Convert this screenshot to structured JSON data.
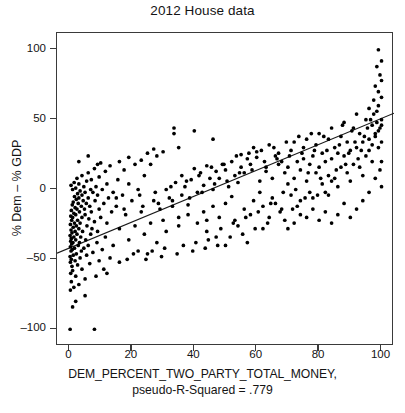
{
  "chart_data": {
    "type": "scatter",
    "title": "2012 House data",
    "xlabel": "DEM_PERCENT_TWO_PARTY_TOTAL_MONEY,",
    "xsublabel": "pseudo-R-Squared = .779",
    "ylabel": "% Dem – % GDP",
    "xlim": [
      -4,
      104
    ],
    "ylim": [
      -112,
      112
    ],
    "xticks": [
      0,
      20,
      40,
      60,
      80,
      100
    ],
    "yticks": [
      100,
      50,
      0,
      -50,
      -100
    ],
    "grid": false,
    "legend": null,
    "point_color": "#000000",
    "line_color": "#1a1a1a",
    "pseudo_r_squared": 0.779,
    "fit_line": {
      "type": "linear",
      "x_endpoints": [
        -4,
        104
      ],
      "y_endpoints": [
        -45.6,
        54.6
      ],
      "slope": 0.9278,
      "intercept": -41.9
    },
    "points": [
      [
        0.2,
        -100
      ],
      [
        8.0,
        -100
      ],
      [
        0.3,
        -72
      ],
      [
        1.4,
        -70
      ],
      [
        3.0,
        -68
      ],
      [
        0.6,
        -66
      ],
      [
        5.0,
        -64
      ],
      [
        2.0,
        -62
      ],
      [
        8.5,
        -62
      ],
      [
        0.4,
        -60
      ],
      [
        1.0,
        -58
      ],
      [
        4.0,
        -57
      ],
      [
        11.0,
        -57
      ],
      [
        0.8,
        -55
      ],
      [
        2.6,
        -54
      ],
      [
        6.5,
        -53
      ],
      [
        0.3,
        -52
      ],
      [
        1.8,
        -51
      ],
      [
        9.5,
        -51
      ],
      [
        0.6,
        -50
      ],
      [
        3.4,
        -49
      ],
      [
        13.0,
        -49
      ],
      [
        0.2,
        -48
      ],
      [
        1.2,
        -47
      ],
      [
        5.5,
        -47
      ],
      [
        2.2,
        -46
      ],
      [
        7.5,
        -45
      ],
      [
        0.5,
        -44
      ],
      [
        3.8,
        -44
      ],
      [
        10.5,
        -43
      ],
      [
        0.9,
        -43
      ],
      [
        1.6,
        -42
      ],
      [
        4.6,
        -42
      ],
      [
        0.3,
        -41
      ],
      [
        2.8,
        -40
      ],
      [
        6.0,
        -40
      ],
      [
        14.0,
        -40
      ],
      [
        0.7,
        -39
      ],
      [
        1.1,
        -38
      ],
      [
        3.2,
        -38
      ],
      [
        8.8,
        -38
      ],
      [
        0.4,
        -37
      ],
      [
        2.0,
        -36
      ],
      [
        5.2,
        -36
      ],
      [
        0.6,
        -35
      ],
      [
        1.4,
        -34
      ],
      [
        3.6,
        -34
      ],
      [
        11.5,
        -34
      ],
      [
        0.2,
        -33
      ],
      [
        2.4,
        -32
      ],
      [
        6.8,
        -32
      ],
      [
        0.8,
        -31
      ],
      [
        1.8,
        -30
      ],
      [
        4.2,
        -30
      ],
      [
        9.0,
        -30
      ],
      [
        0.5,
        -29
      ],
      [
        3.0,
        -28
      ],
      [
        7.2,
        -28
      ],
      [
        16.0,
        -28
      ],
      [
        1.2,
        -27
      ],
      [
        2.2,
        -26
      ],
      [
        5.6,
        -26
      ],
      [
        0.3,
        -25
      ],
      [
        1.6,
        -24
      ],
      [
        3.4,
        -24
      ],
      [
        12.0,
        -24
      ],
      [
        8.0,
        -23
      ],
      [
        0.7,
        -22
      ],
      [
        2.6,
        -22
      ],
      [
        6.2,
        -21
      ],
      [
        1.0,
        -20
      ],
      [
        4.0,
        -20
      ],
      [
        10.0,
        -20
      ],
      [
        0.4,
        -19
      ],
      [
        2.0,
        -18
      ],
      [
        5.0,
        -18
      ],
      [
        18.0,
        -18
      ],
      [
        1.4,
        -17
      ],
      [
        3.2,
        -16
      ],
      [
        7.0,
        -16
      ],
      [
        13.5,
        -16
      ],
      [
        0.6,
        -15
      ],
      [
        2.4,
        -14
      ],
      [
        4.8,
        -14
      ],
      [
        9.5,
        -14
      ],
      [
        1.8,
        -13
      ],
      [
        3.8,
        -12
      ],
      [
        6.5,
        -12
      ],
      [
        15.0,
        -12
      ],
      [
        0.9,
        -11
      ],
      [
        2.8,
        -10
      ],
      [
        5.4,
        -10
      ],
      [
        11.0,
        -10
      ],
      [
        1.2,
        -9
      ],
      [
        4.4,
        -8
      ],
      [
        8.2,
        -8
      ],
      [
        20.0,
        -8
      ],
      [
        2.2,
        -7
      ],
      [
        3.0,
        -6
      ],
      [
        6.0,
        -6
      ],
      [
        12.5,
        -6
      ],
      [
        1.6,
        -5
      ],
      [
        4.0,
        -4
      ],
      [
        9.0,
        -4
      ],
      [
        17.0,
        -4
      ],
      [
        2.6,
        -3
      ],
      [
        5.0,
        -2
      ],
      [
        7.5,
        -2
      ],
      [
        14.0,
        -2
      ],
      [
        3.4,
        -1
      ],
      [
        1.0,
        0
      ],
      [
        6.8,
        0
      ],
      [
        10.5,
        0
      ],
      [
        22.0,
        0
      ],
      [
        2.0,
        1
      ],
      [
        4.6,
        2
      ],
      [
        8.5,
        2
      ],
      [
        0.5,
        3
      ],
      [
        3.0,
        4
      ],
      [
        12.0,
        4
      ],
      [
        19.0,
        4
      ],
      [
        1.5,
        5
      ],
      [
        5.5,
        6
      ],
      [
        7.0,
        7
      ],
      [
        15.5,
        7
      ],
      [
        2.4,
        8
      ],
      [
        9.5,
        9
      ],
      [
        4.0,
        10
      ],
      [
        24.0,
        10
      ],
      [
        6.0,
        12
      ],
      [
        11.5,
        13
      ],
      [
        17.5,
        14
      ],
      [
        8.0,
        15
      ],
      [
        13.0,
        17
      ],
      [
        21.0,
        18
      ],
      [
        26.0,
        18
      ],
      [
        10.0,
        19
      ],
      [
        16.0,
        20
      ],
      [
        23.0,
        21
      ],
      [
        19.0,
        23
      ],
      [
        28.0,
        24
      ],
      [
        33.5,
        40
      ],
      [
        25.0,
        26
      ],
      [
        30.0,
        27
      ],
      [
        27.0,
        29
      ],
      [
        35.0,
        30
      ],
      [
        12.0,
        -60
      ],
      [
        22.0,
        -44
      ],
      [
        25.0,
        -46
      ],
      [
        16.0,
        -52
      ],
      [
        19.0,
        -36
      ],
      [
        28.0,
        -38
      ],
      [
        24.0,
        -32
      ],
      [
        31.0,
        -30
      ],
      [
        21.0,
        -26
      ],
      [
        26.0,
        -24
      ],
      [
        30.0,
        -22
      ],
      [
        35.0,
        -20
      ],
      [
        23.0,
        -16
      ],
      [
        29.0,
        -14
      ],
      [
        33.0,
        -12
      ],
      [
        38.0,
        -11
      ],
      [
        27.0,
        -8
      ],
      [
        32.0,
        -6
      ],
      [
        36.0,
        -4
      ],
      [
        41.0,
        -2
      ],
      [
        31.0,
        0
      ],
      [
        37.0,
        2
      ],
      [
        43.0,
        3
      ],
      [
        34.0,
        5
      ],
      [
        39.0,
        7
      ],
      [
        45.0,
        8
      ],
      [
        36.0,
        10
      ],
      [
        42.0,
        12
      ],
      [
        47.0,
        13
      ],
      [
        40.0,
        15
      ],
      [
        44.0,
        17
      ],
      [
        49.0,
        18
      ],
      [
        38.0,
        -18
      ],
      [
        43.0,
        -16
      ],
      [
        46.0,
        -12
      ],
      [
        41.0,
        -24
      ],
      [
        48.0,
        -20
      ],
      [
        35.0,
        -26
      ],
      [
        44.0,
        -30
      ],
      [
        50.0,
        -10
      ],
      [
        52.0,
        -5
      ],
      [
        46.0,
        0
      ],
      [
        51.0,
        2
      ],
      [
        54.0,
        5
      ],
      [
        48.0,
        8
      ],
      [
        53.0,
        10
      ],
      [
        56.0,
        12
      ],
      [
        50.0,
        14
      ],
      [
        55.0,
        16
      ],
      [
        58.0,
        18
      ],
      [
        52.0,
        20
      ],
      [
        57.0,
        22
      ],
      [
        60.0,
        23
      ],
      [
        47.0,
        -34
      ],
      [
        53.0,
        -22
      ],
      [
        56.0,
        -14
      ],
      [
        59.0,
        -8
      ],
      [
        61.0,
        -2
      ],
      [
        54.0,
        -26
      ],
      [
        58.0,
        -18
      ],
      [
        62.0,
        -12
      ],
      [
        55.0,
        25
      ],
      [
        60.0,
        27
      ],
      [
        63.0,
        13
      ],
      [
        57.0,
        -38
      ],
      [
        62.0,
        -28
      ],
      [
        64.0,
        -20
      ],
      [
        66.0,
        -10
      ],
      [
        61.0,
        6
      ],
      [
        65.0,
        8
      ],
      [
        63.0,
        16
      ],
      [
        67.0,
        18
      ],
      [
        59.0,
        30
      ],
      [
        64.0,
        32
      ],
      [
        68.0,
        20
      ],
      [
        66.0,
        24
      ],
      [
        69.0,
        12
      ],
      [
        70.0,
        4
      ],
      [
        65.0,
        -6
      ],
      [
        68.0,
        -14
      ],
      [
        71.0,
        -4
      ],
      [
        72.0,
        8
      ],
      [
        70.0,
        16
      ],
      [
        73.0,
        20
      ],
      [
        67.0,
        26
      ],
      [
        71.0,
        28
      ],
      [
        74.0,
        14
      ],
      [
        75.0,
        22
      ],
      [
        69.0,
        -22
      ],
      [
        73.0,
        -12
      ],
      [
        76.0,
        6
      ],
      [
        77.0,
        18
      ],
      [
        72.0,
        34
      ],
      [
        75.0,
        30
      ],
      [
        78.0,
        24
      ],
      [
        79.0,
        12
      ],
      [
        74.0,
        -8
      ],
      [
        77.0,
        -2
      ],
      [
        80.0,
        16
      ],
      [
        81.0,
        26
      ],
      [
        76.0,
        36
      ],
      [
        79.0,
        32
      ],
      [
        82.0,
        20
      ],
      [
        83.0,
        10
      ],
      [
        78.0,
        -6
      ],
      [
        81.0,
        4
      ],
      [
        84.0,
        22
      ],
      [
        85.0,
        30
      ],
      [
        80.0,
        40
      ],
      [
        83.0,
        36
      ],
      [
        86.0,
        26
      ],
      [
        87.0,
        16
      ],
      [
        82.0,
        -2
      ],
      [
        85.0,
        8
      ],
      [
        88.0,
        24
      ],
      [
        89.0,
        34
      ],
      [
        84.0,
        44
      ],
      [
        87.0,
        38
      ],
      [
        90.0,
        28
      ],
      [
        91.0,
        18
      ],
      [
        86.0,
        2
      ],
      [
        89.0,
        12
      ],
      [
        92.0,
        30
      ],
      [
        93.0,
        40
      ],
      [
        88.0,
        48
      ],
      [
        91.0,
        44
      ],
      [
        94.0,
        34
      ],
      [
        95.0,
        24
      ],
      [
        90.0,
        6
      ],
      [
        93.0,
        16
      ],
      [
        96.0,
        36
      ],
      [
        97.0,
        46
      ],
      [
        92.0,
        54
      ],
      [
        95.0,
        50
      ],
      [
        98.0,
        40
      ],
      [
        99.0,
        30
      ],
      [
        94.0,
        10
      ],
      [
        97.0,
        20
      ],
      [
        99.5,
        44
      ],
      [
        100.0,
        34
      ],
      [
        96.0,
        58
      ],
      [
        98.5,
        56
      ],
      [
        100.0,
        50
      ],
      [
        99.0,
        60
      ],
      [
        97.5,
        64
      ],
      [
        100.0,
        66
      ],
      [
        99.0,
        70
      ],
      [
        98.0,
        74
      ],
      [
        100.0,
        78
      ],
      [
        99.5,
        82
      ],
      [
        98.5,
        88
      ],
      [
        100.0,
        92
      ],
      [
        99.0,
        100
      ],
      [
        96.0,
        28
      ],
      [
        97.0,
        32
      ],
      [
        98.0,
        38
      ],
      [
        99.0,
        42
      ],
      [
        100.0,
        46
      ],
      [
        95.5,
        44
      ],
      [
        96.5,
        50
      ],
      [
        97.5,
        54
      ],
      [
        98.5,
        48
      ],
      [
        94.5,
        38
      ],
      [
        93.5,
        28
      ],
      [
        92.5,
        22
      ],
      [
        91.5,
        34
      ],
      [
        90.5,
        42
      ],
      [
        89.5,
        26
      ],
      [
        88.5,
        18
      ],
      [
        87.5,
        46
      ],
      [
        86.5,
        32
      ],
      [
        85.5,
        14
      ],
      [
        84.0,
        6
      ],
      [
        83.0,
        -4
      ],
      [
        82.5,
        28
      ],
      [
        81.5,
        38
      ],
      [
        80.5,
        8
      ],
      [
        79.5,
        -4
      ],
      [
        78.5,
        28
      ],
      [
        77.5,
        40
      ],
      [
        76.5,
        12
      ],
      [
        75.5,
        -6
      ],
      [
        74.5,
        26
      ],
      [
        73.5,
        38
      ],
      [
        72.5,
        0
      ],
      [
        71.5,
        -14
      ],
      [
        70.5,
        24
      ],
      [
        69.5,
        34
      ],
      [
        68.5,
        -2
      ],
      [
        67.5,
        -16
      ],
      [
        66.5,
        22
      ],
      [
        65.5,
        30
      ],
      [
        64.5,
        -10
      ],
      [
        63.5,
        -24
      ],
      [
        62.5,
        20
      ],
      [
        61.5,
        28
      ],
      [
        60.5,
        -16
      ],
      [
        59.5,
        -28
      ],
      [
        58.5,
        14
      ],
      [
        57.5,
        26
      ],
      [
        56.5,
        -20
      ],
      [
        55.5,
        -32
      ],
      [
        54.5,
        12
      ],
      [
        53.5,
        24
      ],
      [
        52.5,
        -24
      ],
      [
        51.5,
        -34
      ],
      [
        50.5,
        6
      ],
      [
        49.5,
        18
      ],
      [
        48.5,
        -28
      ],
      [
        47.5,
        -40
      ],
      [
        46.5,
        4
      ],
      [
        45.5,
        16
      ],
      [
        44.5,
        -36
      ],
      [
        43.5,
        -42
      ],
      [
        42.5,
        -2
      ],
      [
        41.5,
        10
      ],
      [
        40.5,
        -38
      ],
      [
        39.5,
        -44
      ],
      [
        38.5,
        -6
      ],
      [
        37.5,
        6
      ],
      [
        36.5,
        -40
      ],
      [
        34.5,
        -46
      ],
      [
        33.0,
        -8
      ],
      [
        32.5,
        2
      ],
      [
        30.5,
        -42
      ],
      [
        29.5,
        -48
      ],
      [
        28.5,
        -10
      ],
      [
        27.5,
        -2
      ],
      [
        26.5,
        -44
      ],
      [
        24.5,
        -50
      ],
      [
        23.5,
        -12
      ],
      [
        22.5,
        -4
      ],
      [
        20.5,
        -46
      ],
      [
        18.5,
        -50
      ],
      [
        17.5,
        -14
      ],
      [
        15.0,
        -6
      ],
      [
        6.0,
        24
      ],
      [
        3.0,
        20
      ],
      [
        9.0,
        18
      ],
      [
        5.0,
        -76
      ],
      [
        2.0,
        -80
      ],
      [
        1.0,
        -84
      ],
      [
        100.0,
        20
      ],
      [
        99.5,
        14
      ],
      [
        98.0,
        8
      ],
      [
        100.0,
        2
      ],
      [
        96.0,
        -2
      ],
      [
        94.0,
        -8
      ],
      [
        92.0,
        -14
      ],
      [
        90.0,
        -20
      ],
      [
        88.0,
        -10
      ],
      [
        86.0,
        -18
      ],
      [
        84.0,
        -24
      ],
      [
        82.0,
        -16
      ],
      [
        80.0,
        -22
      ],
      [
        78.0,
        -14
      ],
      [
        76.0,
        -20
      ],
      [
        74.0,
        -18
      ],
      [
        72.0,
        -24
      ],
      [
        70.0,
        -28
      ],
      [
        33.5,
        44
      ],
      [
        40.0,
        42
      ],
      [
        46.0,
        36
      ],
      [
        50.0,
        -40
      ],
      [
        44.0,
        -22
      ]
    ]
  }
}
